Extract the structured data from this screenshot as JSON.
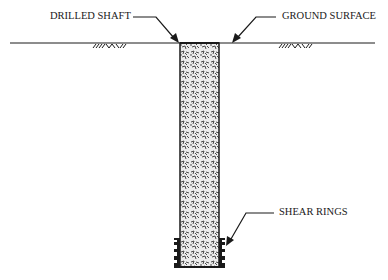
{
  "diagram": {
    "labels": {
      "drilled_shaft": "DRILLED SHAFT",
      "ground_surface": "GROUND SURFACE",
      "shear_rings": "SHEAR RINGS"
    },
    "colors": {
      "line": "#1a1a1a",
      "background": "#ffffff",
      "concrete_fill": "#d9d9d9"
    },
    "components": [
      "ground-surface-line",
      "soil-hatch-left",
      "soil-hatch-right",
      "drilled-shaft",
      "shear-rings"
    ]
  }
}
